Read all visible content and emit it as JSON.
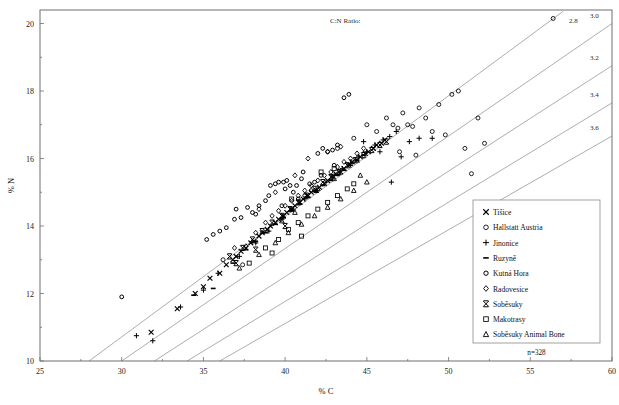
{
  "chart_data": {
    "type": "scatter",
    "title": "",
    "xlabel": "% C",
    "ylabel": "% N",
    "xlim": [
      25,
      60
    ],
    "ylim": [
      10,
      20.4
    ],
    "xticks": [
      25,
      30,
      35,
      40,
      45,
      50,
      55,
      60
    ],
    "yticks": [
      10,
      12,
      14,
      16,
      18,
      20
    ],
    "grid": false,
    "legend_position": "lower-right",
    "annotations": {
      "ratio_title": "C:N Ratio:",
      "ratio_labels": [
        "2.8",
        "3.0",
        "3.2",
        "3.4",
        "3.6"
      ],
      "ratio_values": [
        2.8,
        3.0,
        3.2,
        3.4,
        3.6
      ],
      "sample_count": "n=328"
    },
    "series": [
      {
        "name": "Tišice",
        "marker": "x-cross",
        "points": [
          [
            31.8,
            10.85
          ],
          [
            33.4,
            11.55
          ],
          [
            34.5,
            12.0
          ],
          [
            35.0,
            12.2
          ],
          [
            35.4,
            12.45
          ],
          [
            36.0,
            12.6
          ],
          [
            36.4,
            12.85
          ],
          [
            36.8,
            13.0
          ],
          [
            37.0,
            13.1
          ],
          [
            37.3,
            13.25
          ],
          [
            37.6,
            13.35
          ],
          [
            37.9,
            13.5
          ],
          [
            38.1,
            13.55
          ],
          [
            38.4,
            13.7
          ],
          [
            38.6,
            13.8
          ],
          [
            38.9,
            13.9
          ],
          [
            39.1,
            14.0
          ],
          [
            39.4,
            14.1
          ],
          [
            39.6,
            14.2
          ],
          [
            39.9,
            14.3
          ],
          [
            40.1,
            14.4
          ],
          [
            40.4,
            14.5
          ],
          [
            40.6,
            14.6
          ],
          [
            40.9,
            14.7
          ],
          [
            41.1,
            14.8
          ],
          [
            41.4,
            14.9
          ],
          [
            41.6,
            15.0
          ],
          [
            41.9,
            15.05
          ],
          [
            42.1,
            15.15
          ],
          [
            42.4,
            15.25
          ],
          [
            42.6,
            15.35
          ],
          [
            42.9,
            15.45
          ],
          [
            43.1,
            15.55
          ],
          [
            43.4,
            15.6
          ],
          [
            43.6,
            15.7
          ],
          [
            43.9,
            15.8
          ],
          [
            44.1,
            15.9
          ],
          [
            44.4,
            15.95
          ],
          [
            44.6,
            16.05
          ],
          [
            44.9,
            16.15
          ],
          [
            45.1,
            16.2
          ],
          [
            45.4,
            16.3
          ],
          [
            45.6,
            16.4
          ],
          [
            45.9,
            16.45
          ],
          [
            46.1,
            16.55
          ]
        ]
      },
      {
        "name": "Hallstatt Austria",
        "marker": "open-circle",
        "points": [
          [
            36.2,
            13.0
          ],
          [
            37.4,
            12.85
          ],
          [
            43.2,
            16.3
          ],
          [
            44.2,
            16.6
          ],
          [
            45.0,
            17.0
          ],
          [
            45.6,
            16.8
          ],
          [
            46.2,
            17.2
          ],
          [
            46.6,
            17.0
          ],
          [
            46.9,
            16.9
          ],
          [
            47.2,
            17.35
          ],
          [
            47.5,
            17.0
          ],
          [
            47.8,
            16.95
          ],
          [
            48.2,
            17.5
          ],
          [
            48.6,
            17.2
          ],
          [
            49.0,
            16.8
          ],
          [
            49.4,
            17.6
          ],
          [
            49.8,
            16.7
          ],
          [
            50.2,
            17.9
          ],
          [
            50.6,
            18.0
          ],
          [
            51.0,
            16.3
          ],
          [
            51.4,
            15.55
          ],
          [
            51.8,
            17.2
          ],
          [
            52.2,
            16.45
          ],
          [
            56.4,
            20.15
          ],
          [
            47.0,
            16.2
          ],
          [
            48.0,
            16.1
          ]
        ]
      },
      {
        "name": "Jinonice",
        "marker": "plus",
        "points": [
          [
            30.9,
            10.75
          ],
          [
            31.9,
            10.6
          ],
          [
            33.6,
            11.6
          ],
          [
            35.0,
            12.1
          ],
          [
            35.9,
            12.6
          ],
          [
            37.2,
            13.1
          ],
          [
            38.2,
            13.5
          ],
          [
            39.0,
            13.85
          ],
          [
            39.8,
            14.2
          ],
          [
            40.5,
            14.5
          ],
          [
            41.2,
            14.8
          ],
          [
            41.9,
            15.05
          ],
          [
            42.5,
            15.3
          ],
          [
            43.0,
            15.5
          ],
          [
            43.5,
            15.7
          ],
          [
            44.0,
            15.85
          ],
          [
            44.5,
            16.05
          ],
          [
            45.0,
            16.2
          ],
          [
            45.5,
            16.4
          ],
          [
            46.0,
            16.55
          ],
          [
            46.4,
            16.65
          ],
          [
            46.8,
            16.8
          ],
          [
            47.1,
            16.05
          ],
          [
            47.6,
            16.5
          ],
          [
            48.2,
            16.6
          ],
          [
            49.0,
            16.6
          ],
          [
            46.5,
            15.3
          ],
          [
            44.8,
            16.5
          ],
          [
            45.8,
            16.2
          ]
        ]
      },
      {
        "name": "Ruzyně",
        "marker": "dash",
        "points": [
          [
            34.4,
            11.95
          ],
          [
            35.6,
            12.15
          ],
          [
            36.8,
            12.9
          ],
          [
            37.6,
            13.3
          ],
          [
            38.2,
            13.55
          ],
          [
            38.8,
            13.8
          ],
          [
            39.4,
            14.05
          ],
          [
            39.9,
            14.25
          ],
          [
            40.4,
            14.45
          ],
          [
            40.9,
            14.65
          ],
          [
            41.4,
            14.85
          ],
          [
            41.9,
            15.0
          ],
          [
            42.3,
            15.2
          ],
          [
            42.8,
            15.35
          ],
          [
            43.2,
            15.5
          ],
          [
            43.6,
            15.65
          ],
          [
            44.0,
            15.8
          ],
          [
            44.4,
            15.95
          ],
          [
            44.8,
            16.1
          ]
        ]
      },
      {
        "name": "Kutná Hora",
        "marker": "filled-circle",
        "points": [
          [
            30.0,
            11.9
          ],
          [
            35.2,
            13.6
          ],
          [
            35.6,
            13.75
          ],
          [
            36.0,
            13.85
          ],
          [
            36.4,
            13.95
          ],
          [
            36.9,
            14.2
          ],
          [
            37.3,
            14.25
          ],
          [
            37.7,
            14.55
          ],
          [
            38.0,
            14.4
          ],
          [
            38.4,
            14.6
          ],
          [
            38.8,
            14.75
          ],
          [
            39.1,
            15.2
          ],
          [
            39.4,
            15.25
          ],
          [
            39.6,
            15.3
          ],
          [
            39.9,
            15.3
          ],
          [
            40.1,
            15.35
          ],
          [
            40.3,
            15.2
          ],
          [
            40.5,
            15.0
          ],
          [
            40.7,
            15.2
          ],
          [
            41.0,
            15.4
          ],
          [
            41.2,
            14.9
          ],
          [
            41.5,
            15.25
          ],
          [
            41.8,
            15.3
          ],
          [
            42.0,
            16.15
          ],
          [
            42.3,
            16.3
          ],
          [
            42.6,
            16.2
          ],
          [
            42.9,
            16.25
          ],
          [
            43.2,
            16.4
          ],
          [
            43.6,
            17.8
          ],
          [
            43.9,
            17.9
          ],
          [
            38.2,
            14.35
          ],
          [
            37.0,
            14.5
          ],
          [
            41.6,
            15.05
          ],
          [
            40.0,
            15.1
          ],
          [
            39.0,
            14.9
          ],
          [
            42.2,
            15.5
          ],
          [
            41.1,
            15.6
          ],
          [
            43.0,
            15.8
          ],
          [
            40.8,
            14.8
          ],
          [
            39.8,
            14.6
          ]
        ]
      },
      {
        "name": "Radovesice",
        "marker": "diamond",
        "points": [
          [
            36.9,
            13.35
          ],
          [
            37.6,
            13.4
          ],
          [
            38.2,
            13.8
          ],
          [
            38.8,
            14.1
          ],
          [
            39.2,
            14.3
          ],
          [
            39.6,
            14.45
          ],
          [
            40.0,
            14.6
          ],
          [
            40.4,
            14.75
          ],
          [
            40.8,
            14.9
          ],
          [
            41.2,
            15.05
          ],
          [
            41.6,
            15.2
          ],
          [
            42.0,
            15.35
          ],
          [
            42.4,
            15.5
          ],
          [
            42.8,
            15.6
          ],
          [
            43.2,
            15.75
          ],
          [
            43.6,
            15.9
          ],
          [
            44.0,
            16.0
          ],
          [
            44.4,
            16.15
          ],
          [
            44.8,
            16.3
          ],
          [
            41.4,
            16.0
          ],
          [
            42.6,
            16.2
          ],
          [
            43.4,
            16.35
          ],
          [
            40.6,
            15.5
          ],
          [
            39.4,
            15.0
          ],
          [
            38.4,
            14.5
          ]
        ]
      },
      {
        "name": "Soběsuky",
        "marker": "bowtie",
        "points": [
          [
            36.6,
            13.1
          ],
          [
            37.4,
            13.35
          ],
          [
            38.0,
            13.6
          ],
          [
            38.6,
            13.85
          ],
          [
            39.2,
            14.1
          ],
          [
            39.8,
            14.3
          ],
          [
            40.3,
            14.5
          ],
          [
            40.8,
            14.7
          ],
          [
            41.3,
            14.9
          ],
          [
            41.8,
            15.1
          ],
          [
            42.3,
            15.3
          ],
          [
            42.8,
            15.45
          ],
          [
            43.3,
            15.6
          ],
          [
            43.8,
            15.8
          ],
          [
            44.3,
            15.95
          ],
          [
            44.8,
            16.1
          ],
          [
            45.3,
            16.25
          ],
          [
            45.8,
            16.4
          ],
          [
            46.2,
            16.5
          ],
          [
            40.0,
            14.0
          ],
          [
            38.2,
            13.3
          ],
          [
            37.0,
            12.9
          ]
        ]
      },
      {
        "name": "Makotrasy",
        "marker": "open-square",
        "points": [
          [
            37.8,
            12.9
          ],
          [
            38.8,
            13.35
          ],
          [
            39.6,
            13.6
          ],
          [
            40.2,
            13.9
          ],
          [
            40.8,
            14.1
          ],
          [
            41.4,
            14.3
          ],
          [
            42.0,
            14.5
          ],
          [
            42.6,
            14.7
          ],
          [
            43.2,
            14.9
          ],
          [
            43.8,
            15.1
          ],
          [
            44.2,
            15.25
          ],
          [
            41.0,
            13.7
          ],
          [
            39.2,
            13.2
          ],
          [
            42.2,
            15.6
          ],
          [
            43.0,
            15.7
          ],
          [
            40.4,
            14.8
          ]
        ]
      },
      {
        "name": "Soběsuky Animal Bone",
        "marker": "triangle",
        "points": [
          [
            37.2,
            12.75
          ],
          [
            38.4,
            13.15
          ],
          [
            39.4,
            13.5
          ],
          [
            40.2,
            13.8
          ],
          [
            41.0,
            14.05
          ],
          [
            41.8,
            14.3
          ],
          [
            42.6,
            14.55
          ],
          [
            43.4,
            14.8
          ],
          [
            44.2,
            15.05
          ],
          [
            45.0,
            15.3
          ],
          [
            40.6,
            14.4
          ],
          [
            42.0,
            15.1
          ],
          [
            43.0,
            15.4
          ],
          [
            44.6,
            15.5
          ],
          [
            39.8,
            14.15
          ]
        ]
      }
    ]
  },
  "axes": {
    "x_title": "% C",
    "y_title": "% N",
    "x_ticks": [
      "25",
      "30",
      "35",
      "40",
      "45",
      "50",
      "55",
      "60"
    ],
    "y_ticks": [
      "10",
      "12",
      "14",
      "16",
      "18",
      "20"
    ]
  },
  "legend": {
    "items": [
      {
        "label": "Tišice",
        "marker": "x-cross"
      },
      {
        "label": "Hallstatt Austria",
        "marker": "open-circle"
      },
      {
        "label": "Jinonice",
        "marker": "plus"
      },
      {
        "label": "Ruzyně",
        "marker": "dash"
      },
      {
        "label": "Kutná Hora",
        "marker": "filled-circle"
      },
      {
        "label": "Radovesice",
        "marker": "diamond"
      },
      {
        "label": "Soběsuky",
        "marker": "bowtie"
      },
      {
        "label": "Makotrasy",
        "marker": "open-square"
      },
      {
        "label": "Soběsuky Animal Bone",
        "marker": "triangle"
      }
    ],
    "count_label": "n=328"
  },
  "ratio_annotation": {
    "title": "C:N Ratio:",
    "labels": [
      "2.8",
      "3.0",
      "3.2",
      "3.4",
      "3.6"
    ]
  },
  "colors": {
    "ink": "#000000",
    "frame": "#6f6f6f",
    "ratio_line": "#8a8a8a",
    "background": "#ffffff"
  }
}
